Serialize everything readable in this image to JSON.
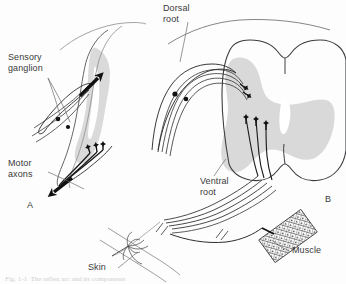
{
  "figure": {
    "background_color": "#fdfdfd",
    "ink_color": "#3a3a3a",
    "gray_matter_color": "#d6d6d6",
    "neuron_color": "#111111"
  },
  "labels": {
    "sensory_ganglion": "Sensory\nganglion",
    "motor_axons": "Motor\naxons",
    "dorsal_root": "Dorsal\nroot",
    "ventral_root": "Ventral\nroot",
    "skin": "Skin",
    "muscle": "Muscle"
  },
  "panels": {
    "a": "A",
    "b": "B"
  },
  "caption": {
    "text": "Fig. 1-1  The reflex arc and its components"
  },
  "icons": {
    "ganglion_cell": "ganglion-cell-body-icon",
    "arrowhead": "axon-arrowhead-icon",
    "synapse": "synapse-terminal-icon",
    "break_mark": "nerve-break-mark-icon"
  }
}
